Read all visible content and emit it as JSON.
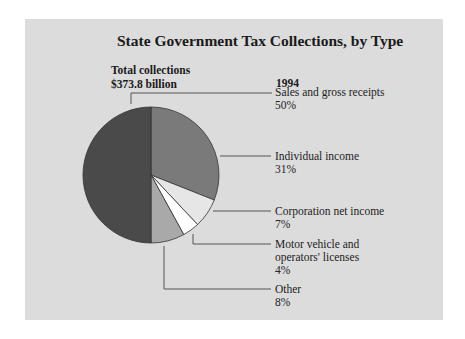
{
  "chart_data": {
    "type": "pie",
    "title": "State Government Tax Collections, by Type",
    "subtitle": "Total collections $373.8 billion",
    "year": "1994",
    "total": "$373.8 billion",
    "categories": [
      "Sales and gross receipts",
      "Individual income",
      "Corporation net income",
      "Motor vehicle and operators' licenses",
      "Other"
    ],
    "values": [
      50,
      31,
      7,
      4,
      8
    ],
    "unit": "%",
    "colors": [
      "#4a4a4a",
      "#7a7a7a",
      "#e6e6e6",
      "#ffffff",
      "#a9a9a9"
    ],
    "legend_position": "right"
  },
  "header": {
    "title": "State Government Tax Collections, by Type",
    "total_label": "Total collections",
    "total_value": "$373.8 billion",
    "year": "1994"
  },
  "labels": [
    {
      "name": "Sales and gross receipts",
      "pct": "50%"
    },
    {
      "name": "Individual income",
      "pct": "31%"
    },
    {
      "name": "Corporation net income",
      "pct": "7%"
    },
    {
      "name_line1": "Motor vehicle and",
      "name_line2": "operators' licenses",
      "pct": "4%"
    },
    {
      "name": "Other",
      "pct": "8%"
    }
  ]
}
